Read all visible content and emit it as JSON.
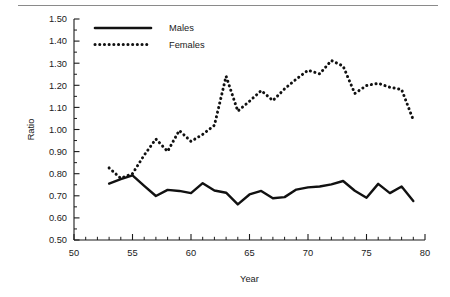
{
  "chart_data": {
    "type": "line",
    "title": "",
    "subtitle": "",
    "xlabel": "Year",
    "ylabel": "Ratio",
    "xlim": [
      50,
      80
    ],
    "ylim": [
      0.5,
      1.5
    ],
    "xticks": [
      50,
      55,
      60,
      65,
      70,
      75,
      80
    ],
    "xtick_labels": [
      "50",
      "55",
      "60",
      "65",
      "70",
      "75",
      "80"
    ],
    "xtick_minor_step": 1,
    "yticks": [
      0.5,
      0.6,
      0.7,
      0.8,
      0.9,
      1.0,
      1.1,
      1.2,
      1.3,
      1.4,
      1.5
    ],
    "ytick_labels": [
      "0.50",
      "0.60",
      "0.70",
      "0.80",
      "0.90",
      "1.00",
      "1.10",
      "1.20",
      "1.30",
      "1.40",
      "1.50"
    ],
    "ytick_minor_step": 0.05,
    "grid": false,
    "legend_position": "top-left",
    "x": [
      53,
      54,
      55,
      56,
      57,
      58,
      59,
      60,
      61,
      62,
      63,
      64,
      65,
      66,
      67,
      68,
      69,
      70,
      71,
      72,
      73,
      74,
      75,
      76,
      77,
      78,
      79
    ],
    "series": [
      {
        "name": "Males",
        "style": "solid",
        "color": "#111111",
        "values": [
          0.755,
          0.775,
          0.792,
          0.745,
          0.699,
          0.727,
          0.722,
          0.712,
          0.757,
          0.724,
          0.714,
          0.661,
          0.706,
          0.722,
          0.689,
          0.694,
          0.728,
          0.738,
          0.742,
          0.752,
          0.767,
          0.723,
          0.691,
          0.754,
          0.712,
          0.742,
          0.676
        ],
        "x_start": 53,
        "x_end": 79
      },
      {
        "name": "Females",
        "style": "dotted",
        "color": "#111111",
        "values": [
          0.826,
          0.779,
          0.8,
          0.884,
          0.957,
          0.901,
          0.996,
          0.946,
          0.978,
          1.019,
          1.241,
          1.083,
          1.128,
          1.176,
          1.131,
          1.184,
          1.228,
          1.268,
          1.252,
          1.312,
          1.287,
          1.163,
          1.199,
          1.209,
          1.191,
          1.181,
          1.043
        ],
        "x_start": 53,
        "x_end": 79
      }
    ],
    "legend": [
      {
        "label": "Males",
        "style": "solid"
      },
      {
        "label": "Females",
        "style": "dotted"
      }
    ]
  },
  "axes": {
    "x_title": "Year",
    "y_title": "Ratio"
  }
}
